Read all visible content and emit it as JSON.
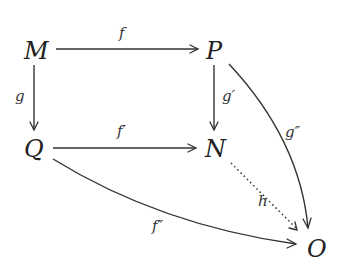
{
  "diagram": {
    "type": "commutative-diagram",
    "nodes": {
      "M": {
        "label": "M",
        "x": 37,
        "y": 50
      },
      "P": {
        "label": "P",
        "x": 217,
        "y": 50
      },
      "Q": {
        "label": "Q",
        "x": 35,
        "y": 148
      },
      "N": {
        "label": "N",
        "x": 215,
        "y": 148
      },
      "O": {
        "label": "O",
        "x": 318,
        "y": 248
      }
    },
    "edges": {
      "f": {
        "from": "M",
        "to": "P",
        "label": "f",
        "style": "solid"
      },
      "g": {
        "from": "M",
        "to": "Q",
        "label": "g",
        "style": "solid"
      },
      "f1": {
        "from": "Q",
        "to": "N",
        "label": "f′",
        "style": "solid"
      },
      "g1": {
        "from": "P",
        "to": "N",
        "label": "g′",
        "style": "solid"
      },
      "g2": {
        "from": "P",
        "to": "O",
        "label": "g″",
        "style": "solid-curved"
      },
      "h": {
        "from": "N",
        "to": "O",
        "label": "h",
        "style": "dotted"
      },
      "f2": {
        "from": "Q",
        "to": "O",
        "label": "f″",
        "style": "solid-curved"
      }
    }
  }
}
